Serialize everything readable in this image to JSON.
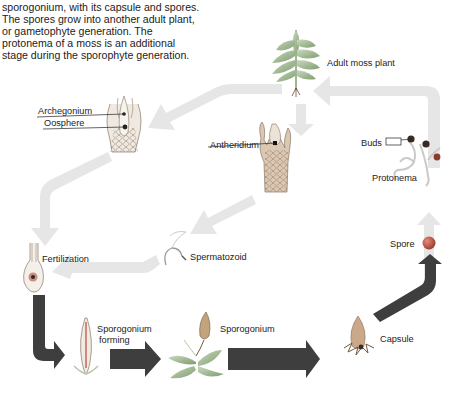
{
  "intro_text": "sporogonium, with its capsule and spores. The spores grow into another adult plant, or gametophyte generation. The protonema of a moss is an additional stage during the sporophyte generation.",
  "labels": {
    "adult_moss_plant": "Adult moss plant",
    "archegonium": "Archegonium",
    "oosphere": "Oosphere",
    "antheridium": "Antheridium",
    "buds": "Buds",
    "protonema": "Protonema",
    "spermatozoid": "Spermatozoid",
    "fertilization": "Fertilization",
    "spore": "Spore",
    "sporogonium_forming_line1": "Sporogonium",
    "sporogonium_forming_line2": "forming",
    "sporogonium": "Sporogonium",
    "capsule": "Capsule"
  },
  "colors": {
    "gametophyte_arrow": "#e6e6e6",
    "sporophyte_arrow": "#3e3e3e",
    "spore": "#c0504d",
    "bud": "#8a3b2d",
    "plant_green": "#9bb58a",
    "capsule": "#c9a98a"
  },
  "cycle": [
    "Adult moss plant",
    "Archegonium / Antheridium",
    "Spermatozoid",
    "Fertilization",
    "Sporogonium forming",
    "Sporogonium",
    "Capsule",
    "Spore",
    "Protonema",
    "Buds"
  ]
}
